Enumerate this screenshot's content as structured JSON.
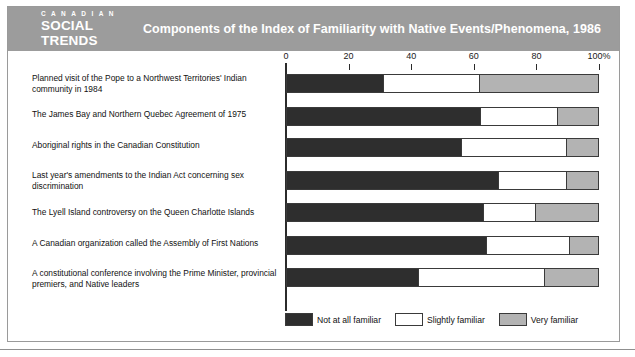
{
  "header": {
    "logo_line1": "C A N A D I A N",
    "logo_line2": "SOCIAL",
    "logo_line3": "TRENDS",
    "title": "Components of the Index of Familiarity with Native Events/Phenomena, 1986",
    "band_color": "#9c9c9c"
  },
  "colors": {
    "not_at_all": "#2e2e2e",
    "slightly": "#ffffff",
    "very": "#b3b3b3",
    "outline": "#3a3a3a"
  },
  "legend": {
    "items": [
      {
        "label": "Not at all familiar",
        "color": "#2e2e2e"
      },
      {
        "label": "Slightly familiar",
        "color": "#ffffff"
      },
      {
        "label": "Very familiar",
        "color": "#b3b3b3"
      }
    ]
  },
  "chart_data": {
    "type": "bar",
    "orientation": "horizontal",
    "stacked": true,
    "stacked_percent": true,
    "title": "Components of the Index of Familiarity with Native Events/Phenomena, 1986",
    "xlabel": "",
    "ylabel": "",
    "xlim": [
      0,
      100
    ],
    "xticks": [
      0,
      20,
      40,
      60,
      80,
      100
    ],
    "xtick_labels": [
      "0",
      "20",
      "40",
      "60",
      "80",
      "100%"
    ],
    "grid": false,
    "legend_position": "bottom-right",
    "categories": [
      "Planned visit of the Pope to a Northwest Territories' Indian community in 1984",
      "The James Bay and Northern Quebec Agreement of 1975",
      "Aboriginal rights in the Canadian Constitution",
      "Last year's amendments to the Indian Act concerning sex discrimination",
      "The Lyell Island controversy on the Queen Charlotte Islands",
      "A Canadian organization called the Assembly of First Nations",
      "A constitutional conference involving the Prime Minister, provincial premiers, and Native leaders"
    ],
    "series": [
      {
        "name": "Not at all familiar",
        "values": [
          31,
          62,
          56,
          68,
          63,
          64,
          42
        ]
      },
      {
        "name": "Slightly familiar",
        "values": [
          31,
          25,
          34,
          22,
          17,
          27,
          41
        ]
      },
      {
        "name": "Very familiar",
        "values": [
          38,
          13,
          10,
          10,
          20,
          9,
          17
        ]
      }
    ]
  }
}
